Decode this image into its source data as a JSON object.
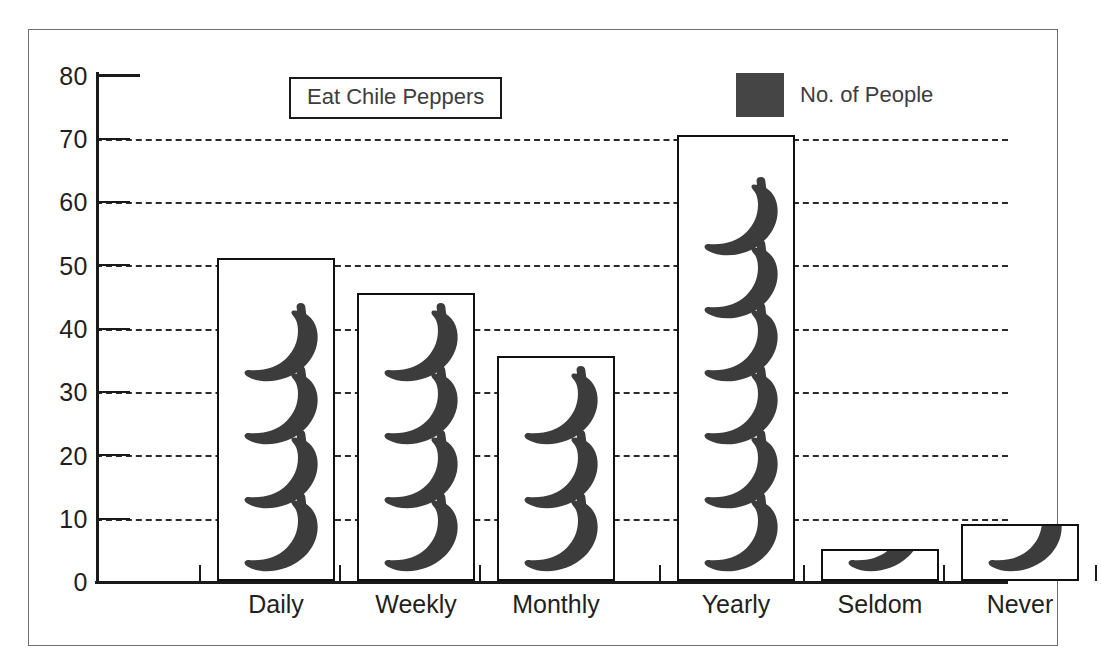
{
  "chart_data": {
    "type": "bar",
    "title": "Eat Chile Peppers",
    "xlabel": "",
    "ylabel": "",
    "ylim": [
      0,
      80
    ],
    "ytick_step": 10,
    "yticks": [
      "80",
      "70",
      "60",
      "50",
      "40",
      "30",
      "20",
      "10",
      "0"
    ],
    "grid": "horizontal-dashed",
    "legend": {
      "position": "top-right",
      "entries": [
        {
          "name": "No. of People",
          "color": "#454545"
        }
      ]
    },
    "categories": [
      "Daily",
      "Weekly",
      "Monthly",
      "Yearly",
      "Seldom",
      "Never"
    ],
    "series": [
      {
        "name": "No. of People",
        "values": [
          51,
          45.5,
          35.5,
          70.5,
          5,
          9
        ]
      }
    ],
    "pictogram": {
      "icon": "chile-pepper-icon",
      "icon_color": "#3c3c3c",
      "counts_per_bar": [
        4,
        4,
        3,
        6,
        1,
        1
      ]
    }
  },
  "legend": {
    "label": "No. of People",
    "swatch_color": "#454545"
  },
  "title": {
    "text": "Eat Chile Peppers"
  },
  "axis": {
    "y_labels": [
      "80",
      "70",
      "60",
      "50",
      "40",
      "30",
      "20",
      "10",
      "0"
    ],
    "x_labels": [
      "Daily",
      "Weekly",
      "Monthly",
      "Yearly",
      "Seldom",
      "Never"
    ]
  },
  "colors": {
    "pepper": "#3c3c3c",
    "bar_outline": "#111111",
    "axis": "#1a1a1a",
    "gridline": "#2b2b2b",
    "frame": "#6e6e70",
    "text": "#231f20"
  }
}
